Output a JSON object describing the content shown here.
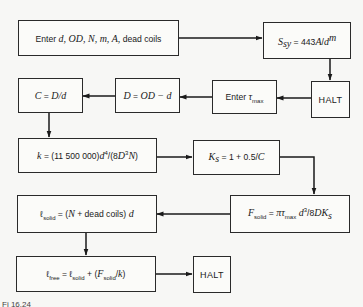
{
  "diagram": {
    "type": "flowchart",
    "nodes": [
      {
        "id": "input",
        "text": "Enter d, OD, N, m, A, dead coils",
        "pre": "Enter ",
        "vars": "d, OD, N, m, A,",
        "post": " dead coils"
      },
      {
        "id": "ssy",
        "text": "S_sy = 443A/d^m",
        "lhs": "S",
        "lhs_sub": "sy",
        "eq": " = 443",
        "A": "A",
        "slash": "/",
        "d": "d",
        "exp": "m"
      },
      {
        "id": "halt1",
        "text": "HALT"
      },
      {
        "id": "tau",
        "text": "Enter τ_max",
        "pre": "Enter ",
        "tau": "τ",
        "sub": "max"
      },
      {
        "id": "D",
        "text": "D = OD − d",
        "lhs": "D",
        "eq": " = ",
        "rhs": "OD − d"
      },
      {
        "id": "C",
        "text": "C = D/d",
        "lhs": "C",
        "eq": " = ",
        "rhs": "D/d"
      },
      {
        "id": "k",
        "text": "k = (11 500 000)d^4/(8D^3N)",
        "lhs": "k",
        "eq": " = (11 500 000)",
        "d": "d",
        "p4": "4",
        "mid": "/(8",
        "D": "D",
        "p3": "3",
        "N": "N",
        "close": ")"
      },
      {
        "id": "Ks",
        "text": "K_s = 1 + 0.5/C",
        "lhs": "K",
        "sub": "s",
        "eq": " = 1 + 0.5/",
        "C": "C"
      },
      {
        "id": "Fsolid",
        "text": "F_solid = πτ_max d^3/8DK_s",
        "F": "F",
        "sub": "solid",
        "eq": " = ",
        "pi": "πτ",
        "max": "max",
        "d": " d",
        "p3": "3",
        "rest": "/8",
        "DK": "DK",
        "s": "s"
      },
      {
        "id": "lsolid",
        "text": "ℓ_solid = (N + dead coils) d",
        "l": "ℓ",
        "sub": "solid",
        "eq": " = (",
        "N": "N",
        "mid": " + dead coils)",
        "d": " d"
      },
      {
        "id": "lfree",
        "text": "ℓ_free = ℓ_solid + (F_solid/k)",
        "l": "ℓ",
        "sub": "free",
        "eq": " = ",
        "l2": "ℓ",
        "sub2": "solid",
        "plus": " + (",
        "F": "F",
        "sub3": "solid",
        "slash": "/",
        "k": "k",
        "close": ")"
      },
      {
        "id": "halt2",
        "text": "HALT"
      }
    ],
    "edges": [
      [
        "input",
        "ssy"
      ],
      [
        "ssy",
        "halt1"
      ],
      [
        "halt1",
        "tau"
      ],
      [
        "tau",
        "D"
      ],
      [
        "D",
        "C"
      ],
      [
        "C",
        "k"
      ],
      [
        "k",
        "Ks"
      ],
      [
        "Ks",
        "Fsolid"
      ],
      [
        "Fsolid",
        "lsolid"
      ],
      [
        "lsolid",
        "lfree"
      ],
      [
        "lfree",
        "halt2"
      ]
    ],
    "caption": "Fi 16.24"
  }
}
